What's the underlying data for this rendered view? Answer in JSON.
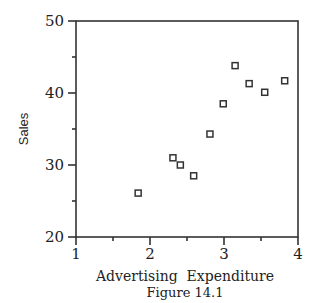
{
  "chart_data": {
    "type": "scatter",
    "title": "",
    "caption": "Figure 14.1",
    "xlabel": "Advertising  Expenditure",
    "ylabel": "Sales",
    "xlim": [
      1,
      4
    ],
    "ylim": [
      20,
      50
    ],
    "xticks": [
      1,
      2,
      3,
      4
    ],
    "yticks": [
      20,
      30,
      40,
      50
    ],
    "x_minor_ticks": [
      1.5,
      2.5,
      3.5
    ],
    "y_minor_ticks": [
      25,
      35,
      45
    ],
    "grid": false,
    "legend": null,
    "marker": "open-square",
    "series": [
      {
        "name": "Sales vs Advertising Expenditure",
        "points": [
          {
            "x": 1.84,
            "y": 26.1
          },
          {
            "x": 2.31,
            "y": 31.0
          },
          {
            "x": 2.41,
            "y": 30.0
          },
          {
            "x": 2.59,
            "y": 28.5
          },
          {
            "x": 2.81,
            "y": 34.3
          },
          {
            "x": 2.99,
            "y": 38.5
          },
          {
            "x": 3.15,
            "y": 43.8
          },
          {
            "x": 3.34,
            "y": 41.3
          },
          {
            "x": 3.55,
            "y": 40.1
          },
          {
            "x": 3.82,
            "y": 41.7
          }
        ]
      }
    ]
  },
  "colors": {
    "axis": "#333333",
    "marker_stroke": "#333333",
    "background": "#ffffff"
  }
}
